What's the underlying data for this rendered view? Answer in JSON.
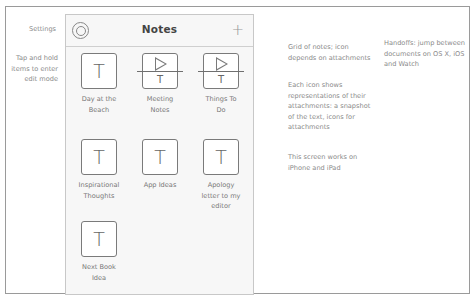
{
  "annotations": {
    "settings": "Settings",
    "tap_hold": [
      "Tap and hold",
      "items to enter",
      "edit mode"
    ],
    "grid_desc": [
      "Grid of notes; icon",
      "depends on attachments"
    ],
    "icon_desc": [
      "Each icon shows",
      "representations of their",
      "attachments: a snapshot",
      "of the text, icons for",
      "attachments"
    ],
    "device_desc": [
      "This screen works on",
      "iPhone and iPad"
    ],
    "handoff_desc": [
      "Handoffs: jump between",
      "documents on OS X, iOS",
      "and Watch"
    ]
  },
  "phone": {
    "header": {
      "title": "Notes",
      "settings_icon": "settings-icon",
      "add_icon": "+"
    },
    "notes": [
      {
        "label": [
          "Day at the",
          "Beach"
        ],
        "icon": "text",
        "glyph": "T"
      },
      {
        "label": [
          "Meeting",
          "Notes"
        ],
        "icon": "media-text",
        "glyph": "T"
      },
      {
        "label": [
          "Things To",
          "Do"
        ],
        "icon": "media-text",
        "glyph": "T"
      },
      {
        "label": [
          "Inspirational",
          "Thoughts"
        ],
        "icon": "text",
        "glyph": "T"
      },
      {
        "label": [
          "App Ideas"
        ],
        "icon": "text",
        "glyph": "T"
      },
      {
        "label": [
          "Apology",
          "letter to my",
          "editor"
        ],
        "icon": "text",
        "glyph": "T"
      },
      {
        "label": [
          "Next Book",
          "Idea"
        ],
        "icon": "text",
        "glyph": "T"
      }
    ]
  }
}
